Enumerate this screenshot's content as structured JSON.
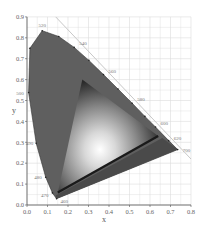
{
  "chart_data": {
    "type": "area",
    "title": "",
    "xlabel": "x",
    "ylabel": "y",
    "xlim": [
      0.0,
      0.8
    ],
    "ylim": [
      0.0,
      0.9
    ],
    "grid": true,
    "x_ticks": [
      "0.0",
      "0.1",
      "0.2",
      "0.3",
      "0.4",
      "0.5",
      "0.6",
      "0.7",
      "0.8"
    ],
    "y_ticks": [
      "0.0",
      "0.1",
      "0.2",
      "0.3",
      "0.4",
      "0.5",
      "0.6",
      "0.7",
      "0.8",
      "0.9"
    ],
    "spectral_locus": [
      {
        "nm": 460,
        "x": 0.144,
        "y": 0.03
      },
      {
        "nm": 470,
        "x": 0.124,
        "y": 0.058
      },
      {
        "nm": 480,
        "x": 0.091,
        "y": 0.133
      },
      {
        "nm": 490,
        "x": 0.045,
        "y": 0.295
      },
      {
        "nm": 500,
        "x": 0.008,
        "y": 0.538
      },
      {
        "nm": 510,
        "x": 0.014,
        "y": 0.75
      },
      {
        "nm": 520,
        "x": 0.074,
        "y": 0.834
      },
      {
        "nm": 530,
        "x": 0.155,
        "y": 0.806
      },
      {
        "nm": 540,
        "x": 0.23,
        "y": 0.754
      },
      {
        "nm": 550,
        "x": 0.302,
        "y": 0.692
      },
      {
        "nm": 560,
        "x": 0.373,
        "y": 0.624
      },
      {
        "nm": 570,
        "x": 0.444,
        "y": 0.555
      },
      {
        "nm": 580,
        "x": 0.513,
        "y": 0.487
      },
      {
        "nm": 590,
        "x": 0.575,
        "y": 0.424
      },
      {
        "nm": 600,
        "x": 0.627,
        "y": 0.373
      },
      {
        "nm": 620,
        "x": 0.691,
        "y": 0.308
      },
      {
        "nm": 700,
        "x": 0.735,
        "y": 0.265
      }
    ],
    "wavelength_labels": [
      "460",
      "470",
      "480",
      "490",
      "500",
      "520",
      "540",
      "560",
      "580",
      "600",
      "620",
      "700"
    ],
    "gamut_triangle": [
      {
        "name": "G",
        "x": 0.27,
        "y": 0.6
      },
      {
        "name": "R",
        "x": 0.64,
        "y": 0.33
      },
      {
        "name": "B",
        "x": 0.15,
        "y": 0.06
      }
    ],
    "colors": {
      "locus_fill": "#5f5f5f",
      "gamut_highlight": "#ffffff",
      "gamut_shadow": "#1a1a1a",
      "grid": "#dcdcdc",
      "axis": "#555555",
      "tick_label": "#666666"
    }
  }
}
